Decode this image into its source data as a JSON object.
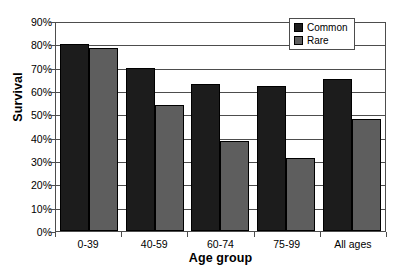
{
  "chart_data": {
    "type": "bar",
    "title": "",
    "xlabel": "Age group",
    "ylabel": "Survival",
    "categories": [
      "0-39",
      "40-59",
      "60-74",
      "75-99",
      "All ages"
    ],
    "series": [
      {
        "name": "Common",
        "color": "#1c1c1c",
        "values": [
          80,
          70,
          63,
          62,
          65
        ]
      },
      {
        "name": "Rare",
        "color": "#5e5e5e",
        "values": [
          78.5,
          54,
          38.5,
          31.5,
          48
        ]
      }
    ],
    "ylim": [
      0,
      90
    ],
    "ytick_values": [
      0,
      10,
      20,
      30,
      40,
      50,
      60,
      70,
      80,
      90
    ],
    "ytick_labels": [
      "0%",
      "10%",
      "20%",
      "30%",
      "40%",
      "50%",
      "60%",
      "70%",
      "80%",
      "90%"
    ],
    "grid": true,
    "grid_axis": "y",
    "legend_position": "top-right",
    "legend_entries": [
      "Common",
      "Rare"
    ],
    "value_format": "percent"
  }
}
